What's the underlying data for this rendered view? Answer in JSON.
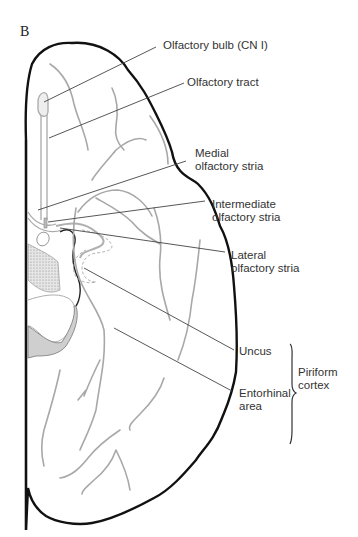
{
  "figure": {
    "panel_letter": "B",
    "labels": {
      "olfactory_bulb": "Olfactory bulb (CN I)",
      "olfactory_tract": "Olfactory tract",
      "medial_stria_1": "Medial",
      "medial_stria_2": "olfactory stria",
      "intermediate_stria_1": "Intermediate",
      "intermediate_stria_2": "olfactory stria",
      "lateral_stria_1": "Lateral",
      "lateral_stria_2": "olfactory stria",
      "uncus": "Uncus",
      "entorhinal_1": "Entorhinal",
      "entorhinal_2": "area",
      "piriform_1": "Piriform",
      "piriform_2": "cortex"
    },
    "colors": {
      "outline": "#111111",
      "sulci": "#a8a8a8",
      "leader_lines": "#444444",
      "stipple_fill": "#d8d8d8",
      "shaded_fill": "#cfcfcf",
      "text": "#333333"
    }
  }
}
